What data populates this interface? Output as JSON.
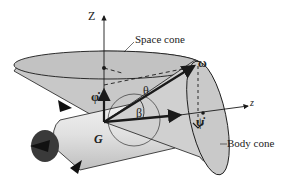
{
  "diagram": {
    "labels": {
      "Z_axis": "Z",
      "z_axis": "z",
      "space_cone": "Space cone",
      "body_cone": "Body cone",
      "omega": "ω",
      "theta": "θ",
      "beta": "β",
      "phi_dot": "φ̇",
      "psi_dot": "ψ̇",
      "G": "G"
    },
    "colors": {
      "stroke": "#1a1a1a",
      "cone_fill": "#bdbdbd",
      "body_fill": "#d6d6d6",
      "background": "#ffffff"
    }
  }
}
